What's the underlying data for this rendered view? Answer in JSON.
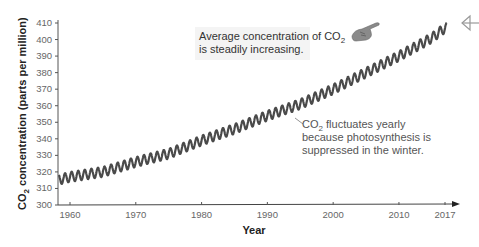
{
  "chart_data": {
    "type": "line",
    "title": "",
    "xlabel": "Year",
    "ylabel": "CO2 concentration (parts per million)",
    "xlim": [
      1958,
      2018
    ],
    "ylim": [
      300,
      410
    ],
    "x_ticks": [
      "1960",
      "1970",
      "1980",
      "1990",
      "2000",
      "2010",
      "2017"
    ],
    "y_ticks": [
      "300",
      "310",
      "320",
      "330",
      "340",
      "350",
      "360",
      "370",
      "380",
      "390",
      "400",
      "410"
    ],
    "grid": false,
    "series": [
      {
        "name": "Atmospheric CO2 (monthly, seasonal oscillation)",
        "color": "#444444",
        "x": [
          1958,
          1960,
          1965,
          1970,
          1975,
          1980,
          1985,
          1990,
          1995,
          2000,
          2005,
          2010,
          2015,
          2017
        ],
        "values": [
          315,
          317,
          320,
          326,
          331,
          339,
          346,
          354,
          361,
          370,
          380,
          390,
          401,
          407
        ],
        "seasonal_amplitude_ppm": 3
      }
    ],
    "annotations": [
      {
        "text_main": "Average concentration of CO",
        "sub": "2",
        "text_line2": "is steadily increasing.",
        "pointer": "pointing-hand-icon"
      },
      {
        "text_main": "CO",
        "sub": "2",
        "text_rest": " fluctuates yearly",
        "line2": "because photosynthesis is",
        "line3": "suppressed in the winter."
      }
    ]
  },
  "labels": {
    "ylabel_pre": "CO",
    "ylabel_sub": "2",
    "ylabel_post": " concentration (parts per million)",
    "xlabel": "Year",
    "note1_line1": "Average concentration of CO",
    "note1_sub": "2",
    "note1_line2": "is steadily increasing.",
    "note2_pre": "CO",
    "note2_sub": "2",
    "note2_line1": " fluctuates yearly",
    "note2_line2": "because photosynthesis is",
    "note2_line3": "suppressed in the winter."
  }
}
